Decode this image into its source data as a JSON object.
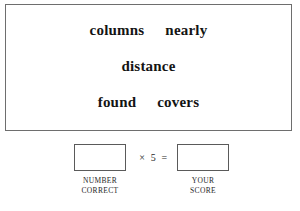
{
  "document": {
    "type": "worksheet-scoring-sheet"
  },
  "word_panel": {
    "name": "word-list-panel",
    "border_color": "#6e6e6e",
    "background": "#ffffff",
    "rows": [
      {
        "words": [
          "columns",
          "nearly"
        ]
      },
      {
        "words": [
          "distance"
        ]
      },
      {
        "words": [
          "found",
          "covers"
        ]
      }
    ]
  },
  "score_section": {
    "operator": "× 5 =",
    "multiplier": 5,
    "number_correct": {
      "value": "",
      "caption_line_1": "NUMBER",
      "caption_line_2": "CORRECT"
    },
    "your_score": {
      "value": "",
      "caption_line_1": "YOUR",
      "caption_line_2": "SCORE"
    }
  }
}
